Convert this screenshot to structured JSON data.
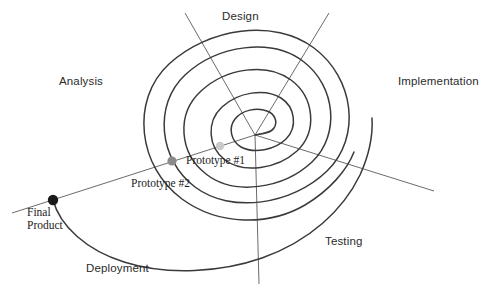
{
  "diagram": {
    "type": "spiral-lifecycle-diagram",
    "background_color": "#ffffff",
    "stroke_color": "#3a3a3a",
    "radial_line_color": "#5a5a5a"
  },
  "phases": [
    {
      "key": "design",
      "label": "Design"
    },
    {
      "key": "analysis",
      "label": "Analysis"
    },
    {
      "key": "implementation",
      "label": "Implementation"
    },
    {
      "key": "testing",
      "label": "Testing"
    },
    {
      "key": "deployment",
      "label": "Deployment"
    }
  ],
  "milestones": [
    {
      "key": "prototype-1",
      "label": "Prototype #1",
      "dot_color": "#c9c9c9"
    },
    {
      "key": "prototype-2",
      "label": "Prototype #2",
      "dot_color": "#8a8a8a"
    },
    {
      "key": "final-product",
      "line1": "Final",
      "line2": "Product",
      "dot_color": "#1a1a1a"
    }
  ]
}
